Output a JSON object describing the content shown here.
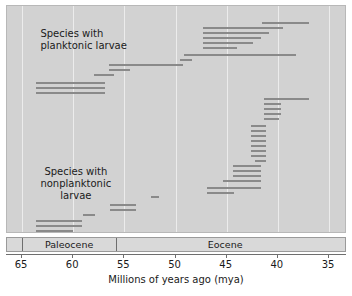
{
  "chart_data": {
    "type": "bar",
    "orientation": "horizontal-ranges",
    "title": "",
    "xlabel": "Millions of years ago (mya)",
    "ylabel": "",
    "xlim": [
      65,
      35
    ],
    "x_ticks": [
      65,
      60,
      55,
      50,
      45,
      40,
      35
    ],
    "x_tick_labels": [
      "65",
      "60",
      "55",
      "50",
      "45",
      "40",
      "35"
    ],
    "x_axis_reversed": true,
    "grid": "vertical-gridlines-at-ticks",
    "legend": "none",
    "annotations": [
      {
        "name": "planktonic-label",
        "text": "Species with\nplanktonic larvae",
        "x_mya": 63.2,
        "y_px": 22
      },
      {
        "name": "nonplanktonic-label",
        "text": "Species with\nnonplanktonic\nlarvae",
        "x_mya": 63.2,
        "y_px": 160
      }
    ],
    "epochs": [
      {
        "name": "Paleocene",
        "start_mya": 65.0,
        "end_mya": 55.8
      },
      {
        "name": "Eocene",
        "start_mya": 55.8,
        "end_mya": 34.5
      }
    ],
    "series": [
      {
        "name": "Species with planktonic larvae",
        "bar_color": "#8a8a8a",
        "ranges": [
          {
            "start_mya": 41.5,
            "end_mya": 37.0,
            "y_px": 16
          },
          {
            "start_mya": 47.3,
            "end_mya": 39.5,
            "y_px": 21
          },
          {
            "start_mya": 47.3,
            "end_mya": 40.9,
            "y_px": 26
          },
          {
            "start_mya": 47.3,
            "end_mya": 41.6,
            "y_px": 31
          },
          {
            "start_mya": 47.3,
            "end_mya": 42.4,
            "y_px": 36
          },
          {
            "start_mya": 47.3,
            "end_mya": 44.0,
            "y_px": 41
          },
          {
            "start_mya": 49.2,
            "end_mya": 38.2,
            "y_px": 48
          },
          {
            "start_mya": 49.6,
            "end_mya": 48.4,
            "y_px": 53
          },
          {
            "start_mya": 56.5,
            "end_mya": 49.3,
            "y_px": 58
          },
          {
            "start_mya": 56.5,
            "end_mya": 54.4,
            "y_px": 63
          },
          {
            "start_mya": 58.0,
            "end_mya": 56.0,
            "y_px": 68
          },
          {
            "start_mya": 63.6,
            "end_mya": 56.9,
            "y_px": 76
          },
          {
            "start_mya": 63.6,
            "end_mya": 56.9,
            "y_px": 81
          },
          {
            "start_mya": 63.6,
            "end_mya": 56.9,
            "y_px": 86
          }
        ]
      },
      {
        "name": "Species with nonplanktonic larvae",
        "bar_color": "#8a8a8a",
        "ranges": [
          {
            "start_mya": 41.4,
            "end_mya": 37.0,
            "y_px": 92
          },
          {
            "start_mya": 41.4,
            "end_mya": 39.7,
            "y_px": 97
          },
          {
            "start_mya": 41.4,
            "end_mya": 39.7,
            "y_px": 102
          },
          {
            "start_mya": 41.4,
            "end_mya": 39.7,
            "y_px": 107
          },
          {
            "start_mya": 41.4,
            "end_mya": 39.9,
            "y_px": 112
          },
          {
            "start_mya": 42.6,
            "end_mya": 41.2,
            "y_px": 119
          },
          {
            "start_mya": 42.6,
            "end_mya": 41.2,
            "y_px": 124
          },
          {
            "start_mya": 42.6,
            "end_mya": 41.2,
            "y_px": 129
          },
          {
            "start_mya": 42.6,
            "end_mya": 41.2,
            "y_px": 134
          },
          {
            "start_mya": 42.6,
            "end_mya": 41.2,
            "y_px": 139
          },
          {
            "start_mya": 42.6,
            "end_mya": 41.2,
            "y_px": 144
          },
          {
            "start_mya": 42.6,
            "end_mya": 41.2,
            "y_px": 149
          },
          {
            "start_mya": 42.2,
            "end_mya": 41.2,
            "y_px": 154
          },
          {
            "start_mya": 44.4,
            "end_mya": 41.6,
            "y_px": 159
          },
          {
            "start_mya": 44.4,
            "end_mya": 41.6,
            "y_px": 164
          },
          {
            "start_mya": 44.4,
            "end_mya": 41.6,
            "y_px": 169
          },
          {
            "start_mya": 45.4,
            "end_mya": 41.6,
            "y_px": 174
          },
          {
            "start_mya": 46.9,
            "end_mya": 41.6,
            "y_px": 181
          },
          {
            "start_mya": 46.9,
            "end_mya": 44.3,
            "y_px": 186
          },
          {
            "start_mya": 52.4,
            "end_mya": 51.6,
            "y_px": 190
          },
          {
            "start_mya": 56.4,
            "end_mya": 53.9,
            "y_px": 198
          },
          {
            "start_mya": 56.4,
            "end_mya": 53.9,
            "y_px": 203
          },
          {
            "start_mya": 59.0,
            "end_mya": 57.9,
            "y_px": 208
          },
          {
            "start_mya": 63.6,
            "end_mya": 59.1,
            "y_px": 214
          },
          {
            "start_mya": 63.6,
            "end_mya": 59.1,
            "y_px": 219
          },
          {
            "start_mya": 63.6,
            "end_mya": 60.0,
            "y_px": 224
          }
        ]
      }
    ]
  },
  "labels": {
    "planktonic": "Species with\nplanktonic larvae",
    "nonplanktonic": "Species with\nnonplanktonic\nlarvae"
  }
}
